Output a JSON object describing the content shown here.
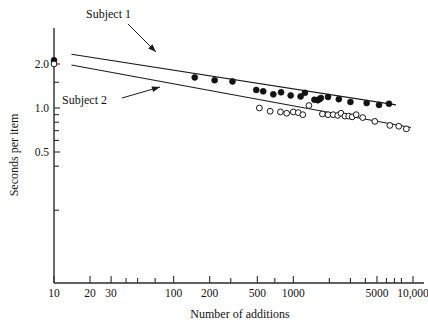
{
  "chart_data": {
    "type": "scatter",
    "title": "",
    "xlabel": "Number of additions",
    "ylabel": "Seconds per item",
    "xscale": "log",
    "yscale": "log",
    "xlim": [
      10,
      12000
    ],
    "ylim": [
      0.18,
      2.6
    ],
    "grid": false,
    "legend_position": "inline-annotations",
    "xticks": [
      {
        "value": 10,
        "label": "10",
        "major": true
      },
      {
        "value": 20,
        "label": "20",
        "major": true
      },
      {
        "value": 30,
        "label": "30",
        "major": true
      },
      {
        "value": 40,
        "label": "",
        "major": false
      },
      {
        "value": 50,
        "label": "",
        "major": false
      },
      {
        "value": 70,
        "label": "",
        "major": false
      },
      {
        "value": 100,
        "label": "100",
        "major": true
      },
      {
        "value": 200,
        "label": "200",
        "major": true
      },
      {
        "value": 300,
        "label": "",
        "major": false
      },
      {
        "value": 500,
        "label": "500",
        "major": true
      },
      {
        "value": 700,
        "label": "",
        "major": false
      },
      {
        "value": 1000,
        "label": "1000",
        "major": true
      },
      {
        "value": 2000,
        "label": "",
        "major": false
      },
      {
        "value": 3000,
        "label": "",
        "major": false
      },
      {
        "value": 4000,
        "label": "",
        "major": false
      },
      {
        "value": 5000,
        "label": "5000",
        "major": true
      },
      {
        "value": 6000,
        "label": "",
        "major": false
      },
      {
        "value": 7000,
        "label": "",
        "major": false
      },
      {
        "value": 8000,
        "label": "",
        "major": false
      },
      {
        "value": 10000,
        "label": "10,000",
        "major": true
      }
    ],
    "yticks": [
      {
        "value": 2.0,
        "label": "2.0"
      },
      {
        "value": 1.5,
        "label": ""
      },
      {
        "value": 1.0,
        "label": "1.0"
      },
      {
        "value": 0.9,
        "label": ""
      },
      {
        "value": 0.8,
        "label": ""
      },
      {
        "value": 0.7,
        "label": ""
      },
      {
        "value": 0.6,
        "label": ""
      },
      {
        "value": 0.5,
        "label": "0.5"
      },
      {
        "value": 0.4,
        "label": ""
      },
      {
        "value": 0.2,
        "label": ""
      }
    ],
    "series": [
      {
        "name": "Subject 1",
        "marker": "filled-circle",
        "color": "#121212",
        "label_text": "Subject 1",
        "points": [
          [
            10,
            2.12
          ],
          [
            150,
            1.62
          ],
          [
            220,
            1.55
          ],
          [
            310,
            1.52
          ],
          [
            490,
            1.33
          ],
          [
            560,
            1.3
          ],
          [
            680,
            1.24
          ],
          [
            790,
            1.28
          ],
          [
            950,
            1.22
          ],
          [
            1150,
            1.2
          ],
          [
            1250,
            1.27
          ],
          [
            1500,
            1.14
          ],
          [
            1600,
            1.13
          ],
          [
            1650,
            1.15
          ],
          [
            1700,
            1.17
          ],
          [
            1950,
            1.19
          ],
          [
            2400,
            1.15
          ],
          [
            3000,
            1.1
          ],
          [
            4100,
            1.08
          ],
          [
            5200,
            1.05
          ],
          [
            6300,
            1.07
          ]
        ],
        "fit_line": {
          "x1": 14,
          "y1": 2.33,
          "x2": 7200,
          "y2": 1.05
        }
      },
      {
        "name": "Subject 2",
        "marker": "open-circle",
        "color": "#151515",
        "label_text": "Subject 2",
        "points": [
          [
            10,
            2.0
          ],
          [
            520,
            1.0
          ],
          [
            640,
            0.95
          ],
          [
            780,
            0.94
          ],
          [
            880,
            0.92
          ],
          [
            1000,
            0.94
          ],
          [
            1100,
            0.93
          ],
          [
            1200,
            0.9
          ],
          [
            1350,
            1.04
          ],
          [
            1750,
            0.91
          ],
          [
            1950,
            0.9
          ],
          [
            2150,
            0.9
          ],
          [
            2350,
            0.89
          ],
          [
            2500,
            0.92
          ],
          [
            2700,
            0.88
          ],
          [
            2900,
            0.88
          ],
          [
            3100,
            0.87
          ],
          [
            3350,
            0.9
          ],
          [
            3800,
            0.86
          ],
          [
            4800,
            0.81
          ],
          [
            6400,
            0.76
          ],
          [
            7600,
            0.75
          ],
          [
            8800,
            0.72
          ]
        ],
        "fit_line": {
          "x1": 14,
          "y1": 1.97,
          "x2": 9600,
          "y2": 0.735
        }
      }
    ],
    "annotations": [
      {
        "text": "Subject 1",
        "points_to_series": "Subject 1"
      },
      {
        "text": "Subject 2",
        "points_to_series": "Subject 2"
      }
    ]
  },
  "labels": {
    "y_axis_title": "Seconds per item",
    "x_axis_title": "Number of additions",
    "subject1": "Subject 1",
    "subject2": "Subject 2"
  },
  "colors": {
    "axis": "#2b2b2b",
    "ink": "#111111",
    "filled_marker": "#121212",
    "open_marker_stroke": "#151515",
    "open_marker_fill": "#ffffff",
    "background": "#ffffff"
  }
}
